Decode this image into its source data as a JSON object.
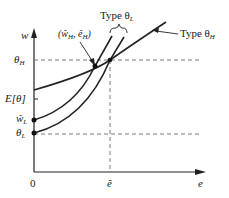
{
  "diagram": {
    "axes": {
      "y_label": "w",
      "x_label": "e",
      "origin_label": "0"
    },
    "y_ticks": [
      {
        "label": "θ",
        "sub": "H",
        "meaning": "theta_H"
      },
      {
        "label": "E[θ]",
        "sub": "",
        "meaning": "expected theta"
      },
      {
        "label": "ŵ",
        "sub": "L",
        "meaning": "w-hat_L"
      },
      {
        "label": "θ",
        "sub": "L",
        "meaning": "theta_L"
      }
    ],
    "x_ticks": [
      {
        "label": "ẽ",
        "meaning": "e-tilde"
      }
    ],
    "annotations": {
      "type_L": {
        "text": "Type θ",
        "sub": "L"
      },
      "type_H": {
        "text": "Type θ",
        "sub": "H"
      },
      "point": {
        "text": "(ŵ",
        "sub1": "H",
        "mid": ", ê",
        "sub2": "H",
        "end": ")"
      }
    },
    "colors": {
      "line": "#222222",
      "dash": "#555555"
    }
  }
}
